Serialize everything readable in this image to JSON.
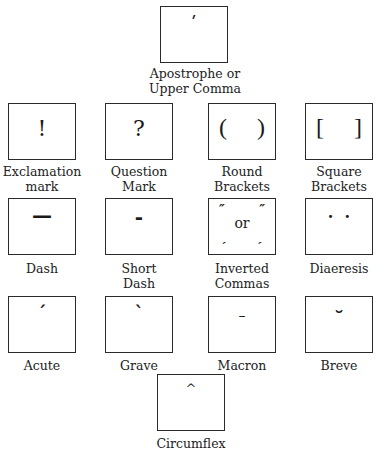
{
  "diagram": {
    "items": [
      {
        "id": "apostrophe",
        "glyph": "ʹ",
        "label": "Apostrophe or\nUpper Comma"
      },
      {
        "id": "exclamation",
        "glyph": "!",
        "label": "Exclamation\nmark"
      },
      {
        "id": "question",
        "glyph": "?",
        "label": "Question\nMark"
      },
      {
        "id": "round",
        "glyph": "(     )",
        "label": "Round\nBrackets"
      },
      {
        "id": "square",
        "glyph": "[     ]",
        "label": "Square\nBrackets"
      },
      {
        "id": "dash",
        "glyph": "—",
        "label": "Dash"
      },
      {
        "id": "short-dash",
        "glyph": "-",
        "label": "Short\nDash"
      },
      {
        "id": "inverted",
        "glyph_open": "″",
        "glyph_or": "or",
        "glyph_low": "ˏ",
        "label": "Inverted\nCommas"
      },
      {
        "id": "diaeresis",
        "glyph": "·  ·",
        "label": "Diaeresis"
      },
      {
        "id": "acute",
        "glyph": "ˊ",
        "label": "Acute"
      },
      {
        "id": "grave",
        "glyph": "ˋ",
        "label": "Grave"
      },
      {
        "id": "macron",
        "glyph": "–",
        "label": "Macron"
      },
      {
        "id": "breve",
        "glyph": "˘",
        "label": "Breve"
      },
      {
        "id": "circumflex",
        "glyph": "^",
        "label": "Circumflex"
      }
    ]
  }
}
